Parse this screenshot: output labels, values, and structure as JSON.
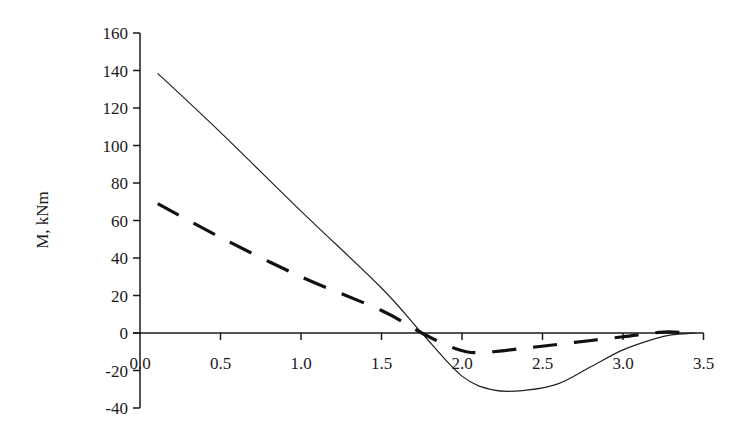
{
  "chart_data": {
    "type": "line",
    "title": "",
    "xlabel": "",
    "ylabel": "M, kNm",
    "xlim": [
      0.0,
      3.5
    ],
    "ylim": [
      -40,
      160
    ],
    "x_ticks": [
      "0.0",
      "0.5",
      "1.0",
      "1.5",
      "2.0",
      "2.5",
      "3.0",
      "3.5"
    ],
    "y_ticks": [
      "160",
      "140",
      "120",
      "100",
      "80",
      "60",
      "40",
      "20",
      "0",
      "-20",
      "-40"
    ],
    "grid": false,
    "legend": null,
    "series": [
      {
        "name": "solid",
        "style": "solid",
        "color": "#222222",
        "x": [
          0.11,
          0.5,
          1.0,
          1.5,
          1.75,
          2.0,
          2.2,
          2.4,
          2.6,
          2.8,
          3.0,
          3.2,
          3.3,
          3.45
        ],
        "y": [
          138.5,
          107,
          65,
          24,
          0,
          -23,
          -30.5,
          -30.5,
          -27,
          -18,
          -9,
          -3,
          -1,
          0
        ]
      },
      {
        "name": "dashed",
        "style": "dashed",
        "color": "#111111",
        "x": [
          0.11,
          0.5,
          1.0,
          1.5,
          1.75,
          1.95,
          2.1,
          2.4,
          2.7,
          3.0,
          3.25,
          3.4
        ],
        "y": [
          69,
          51,
          30,
          12,
          0,
          -8,
          -10.5,
          -8,
          -5,
          -2,
          0.5,
          0
        ]
      }
    ]
  }
}
